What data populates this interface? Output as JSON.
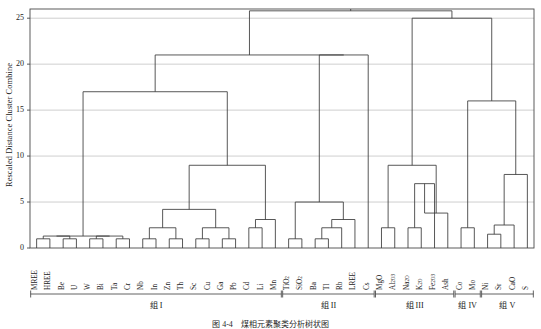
{
  "chart_data": {
    "type": "dendrogram",
    "title": "",
    "ylabel": "Rescaled Distance Cluster Combine",
    "xlabel": "",
    "ylim": [
      0,
      26
    ],
    "yticks": [
      0,
      5,
      10,
      15,
      20,
      25
    ],
    "grid": true,
    "legend": "none",
    "leaf_count": 37,
    "leaves": [
      "MREE",
      "HREE",
      "Be",
      "U",
      "W",
      "Bi",
      "Ta",
      "Cr",
      "Nb",
      "In",
      "Zn",
      "Th",
      "Sc",
      "Cu",
      "Ga",
      "Pb",
      "Cd",
      "Li",
      "Mn",
      "TiO2",
      "SiO2",
      "Ba",
      "Tl",
      "Rb",
      "LREE",
      "Cs",
      "MgO",
      "Al2O3",
      "Na2O",
      "K2O",
      "Fe2O3",
      "Ash",
      "Co",
      "Mo",
      "Ni",
      "Sr",
      "CaO",
      "S"
    ],
    "leaf_labels_display": [
      {
        "base": "MREE",
        "sub": ""
      },
      {
        "base": "HREE",
        "sub": ""
      },
      {
        "base": "Be",
        "sub": ""
      },
      {
        "base": "U",
        "sub": ""
      },
      {
        "base": "W",
        "sub": ""
      },
      {
        "base": "Bi",
        "sub": ""
      },
      {
        "base": "Ta",
        "sub": ""
      },
      {
        "base": "Cr",
        "sub": ""
      },
      {
        "base": "Nb",
        "sub": ""
      },
      {
        "base": "In",
        "sub": ""
      },
      {
        "base": "Zn",
        "sub": ""
      },
      {
        "base": "Th",
        "sub": ""
      },
      {
        "base": "Sc",
        "sub": ""
      },
      {
        "base": "Cu",
        "sub": ""
      },
      {
        "base": "Ga",
        "sub": ""
      },
      {
        "base": "Pb",
        "sub": ""
      },
      {
        "base": "Cd",
        "sub": ""
      },
      {
        "base": "Li",
        "sub": ""
      },
      {
        "base": "Mn",
        "sub": ""
      },
      {
        "base": "TiO",
        "sub": "2"
      },
      {
        "base": "SiO",
        "sub": "2"
      },
      {
        "base": "Ba",
        "sub": ""
      },
      {
        "base": "Tl",
        "sub": ""
      },
      {
        "base": "Rb",
        "sub": ""
      },
      {
        "base": "LREE",
        "sub": ""
      },
      {
        "base": "Cs",
        "sub": ""
      },
      {
        "base": "MgO",
        "sub": ""
      },
      {
        "base": "Al",
        "sub": "2O3"
      },
      {
        "base": "Na",
        "sub": "2O"
      },
      {
        "base": "K",
        "sub": "2O"
      },
      {
        "base": "Fe",
        "sub": "2O3"
      },
      {
        "base": "Ash",
        "sub": ""
      },
      {
        "base": "Co",
        "sub": ""
      },
      {
        "base": "Mo",
        "sub": ""
      },
      {
        "base": "Ni",
        "sub": ""
      },
      {
        "base": "Sr",
        "sub": ""
      },
      {
        "base": "CaO",
        "sub": ""
      },
      {
        "base": "S",
        "sub": ""
      }
    ],
    "merges": [
      {
        "id": "m1",
        "left": {
          "type": "leaf",
          "i": 0
        },
        "right": {
          "type": "leaf",
          "i": 1
        },
        "height": 1.0
      },
      {
        "id": "m2",
        "left": {
          "type": "leaf",
          "i": 2
        },
        "right": {
          "type": "leaf",
          "i": 3
        },
        "height": 1.0
      },
      {
        "id": "m3",
        "left": {
          "type": "leaf",
          "i": 4
        },
        "right": {
          "type": "leaf",
          "i": 5
        },
        "height": 1.0
      },
      {
        "id": "m4",
        "left": {
          "type": "leaf",
          "i": 6
        },
        "right": {
          "type": "leaf",
          "i": 7
        },
        "height": 1.0
      },
      {
        "id": "m5",
        "left": {
          "type": "leaf",
          "i": 8
        },
        "right": {
          "type": "leaf",
          "i": 9
        },
        "height": 1.0
      },
      {
        "id": "m6",
        "left": {
          "type": "leaf",
          "i": 10
        },
        "right": {
          "type": "leaf",
          "i": 11
        },
        "height": 1.0
      },
      {
        "id": "m7",
        "left": {
          "type": "leaf",
          "i": 12
        },
        "right": {
          "type": "leaf",
          "i": 13
        },
        "height": 1.0
      },
      {
        "id": "m8",
        "left": {
          "type": "leaf",
          "i": 14
        },
        "right": {
          "type": "leaf",
          "i": 15
        },
        "height": 1.0
      },
      {
        "id": "m9",
        "left": {
          "type": "node",
          "r": "m5"
        },
        "right": {
          "type": "node",
          "r": "m6"
        },
        "height": 2.2
      },
      {
        "id": "m10",
        "left": {
          "type": "node",
          "r": "m7"
        },
        "right": {
          "type": "node",
          "r": "m8"
        },
        "height": 2.2
      },
      {
        "id": "m11",
        "left": {
          "type": "node",
          "r": "m9"
        },
        "right": {
          "type": "node",
          "r": "m10"
        },
        "height": 4.2
      },
      {
        "id": "m12",
        "left": {
          "type": "leaf",
          "i": 16
        },
        "right": {
          "type": "leaf",
          "i": 17
        },
        "height": 2.2
      },
      {
        "id": "m13",
        "left": {
          "type": "node",
          "r": "m12"
        },
        "right": {
          "type": "leaf",
          "i": 18
        },
        "height": 3.1
      },
      {
        "id": "m14",
        "left": {
          "type": "node",
          "r": "m11"
        },
        "right": {
          "type": "node",
          "r": "m13"
        },
        "height": 9.0
      },
      {
        "id": "m15",
        "left": {
          "type": "node",
          "r": "m1"
        },
        "right": {
          "type": "node",
          "r": "m2"
        },
        "height": 1.3
      },
      {
        "id": "m16",
        "left": {
          "type": "node",
          "r": "m3"
        },
        "right": {
          "type": "node",
          "r": "m4"
        },
        "height": 1.3
      },
      {
        "id": "m17",
        "left": {
          "type": "node",
          "r": "m15"
        },
        "right": {
          "type": "node",
          "r": "m16"
        },
        "height": 1.3
      },
      {
        "id": "m18",
        "left": {
          "type": "node",
          "r": "m17"
        },
        "right": {
          "type": "node",
          "r": "m14"
        },
        "height": 17.0
      },
      {
        "id": "m19",
        "left": {
          "type": "leaf",
          "i": 19
        },
        "right": {
          "type": "leaf",
          "i": 20
        },
        "height": 1.0
      },
      {
        "id": "m20",
        "left": {
          "type": "leaf",
          "i": 21
        },
        "right": {
          "type": "leaf",
          "i": 22
        },
        "height": 1.0
      },
      {
        "id": "m21",
        "left": {
          "type": "node",
          "r": "m20"
        },
        "right": {
          "type": "leaf",
          "i": 23
        },
        "height": 2.2
      },
      {
        "id": "m22",
        "left": {
          "type": "node",
          "r": "m21"
        },
        "right": {
          "type": "leaf",
          "i": 24
        },
        "height": 3.1
      },
      {
        "id": "m23",
        "left": {
          "type": "node",
          "r": "m19"
        },
        "right": {
          "type": "node",
          "r": "m22"
        },
        "height": 5.0
      },
      {
        "id": "m24",
        "left": {
          "type": "node",
          "r": "m23"
        },
        "right": {
          "type": "leaf",
          "i": 25
        },
        "height": 21.0
      },
      {
        "id": "m25",
        "left": {
          "type": "node",
          "r": "m18"
        },
        "right": {
          "type": "node",
          "r": "m24"
        },
        "height": 21.0
      },
      {
        "id": "m26",
        "left": {
          "type": "leaf",
          "i": 26
        },
        "right": {
          "type": "leaf",
          "i": 27
        },
        "height": 2.2
      },
      {
        "id": "m27",
        "left": {
          "type": "leaf",
          "i": 28
        },
        "right": {
          "type": "leaf",
          "i": 29
        },
        "height": 2.2
      },
      {
        "id": "m28",
        "left": {
          "type": "node",
          "r": "m27"
        },
        "right": {
          "type": "leaf",
          "i": 30
        },
        "height": 7.0
      },
      {
        "id": "m29",
        "left": {
          "type": "node",
          "r": "m28"
        },
        "right": {
          "type": "leaf",
          "i": 31
        },
        "height": 3.8
      },
      {
        "id": "m30",
        "left": {
          "type": "node",
          "r": "m26"
        },
        "right": {
          "type": "node",
          "r": "m29"
        },
        "height": 9.0
      },
      {
        "id": "m31",
        "left": {
          "type": "leaf",
          "i": 32
        },
        "right": {
          "type": "leaf",
          "i": 33
        },
        "height": 2.2
      },
      {
        "id": "m32",
        "left": {
          "type": "leaf",
          "i": 34
        },
        "right": {
          "type": "leaf",
          "i": 35
        },
        "height": 1.5
      },
      {
        "id": "m33",
        "left": {
          "type": "node",
          "r": "m32"
        },
        "right": {
          "type": "leaf",
          "i": 36
        },
        "height": 2.5
      },
      {
        "id": "m34",
        "left": {
          "type": "node",
          "r": "m33"
        },
        "right": {
          "type": "leaf",
          "i": 37
        },
        "height": 8.0
      },
      {
        "id": "m35",
        "left": {
          "type": "node",
          "r": "m34"
        },
        "right": {
          "type": "node",
          "r": "m31"
        },
        "height": 16.0
      },
      {
        "id": "m36",
        "left": {
          "type": "node",
          "r": "m30"
        },
        "right": {
          "type": "node",
          "r": "m35"
        },
        "height": 25.0
      },
      {
        "id": "root",
        "left": {
          "type": "node",
          "r": "m25"
        },
        "right": {
          "type": "node",
          "r": "m36"
        },
        "height": 25.8
      }
    ],
    "groups": [
      {
        "name": "组 I",
        "first_leaf": 0,
        "last_leaf": 18
      },
      {
        "name": "组 II",
        "first_leaf": 19,
        "last_leaf": 25
      },
      {
        "name": "组 III",
        "first_leaf": 26,
        "last_leaf": 31
      },
      {
        "name": "组 IV",
        "first_leaf": 32,
        "last_leaf": 33
      },
      {
        "name": "组 V",
        "first_leaf": 34,
        "last_leaf": 37
      }
    ],
    "colors": {
      "line": "#3a3a3a",
      "grid": "#b9b9b9",
      "frame": "#4a4a4a",
      "text": "#1a1a1a"
    }
  },
  "caption": "图 4-4　煤相元素聚类分析树状图"
}
